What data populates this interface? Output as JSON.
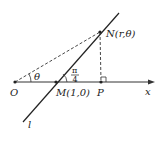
{
  "diagram": {
    "type": "polar-coordinate-geometry",
    "points": {
      "O": {
        "label": "O",
        "x": 15,
        "y": 82
      },
      "M": {
        "label": "M(1,0)",
        "x": 56,
        "y": 82
      },
      "P": {
        "label": "P",
        "x": 101,
        "y": 82
      },
      "N": {
        "label": "N(r,θ)",
        "x": 100,
        "y": 32
      }
    },
    "axis": {
      "label": "x"
    },
    "line": {
      "label": "l"
    },
    "angles": {
      "theta": {
        "label": "θ"
      },
      "pi_over_4": {
        "numerator": "π",
        "denominator": "4"
      }
    },
    "colors": {
      "stroke": "#222222",
      "background": "#ffffff"
    }
  }
}
